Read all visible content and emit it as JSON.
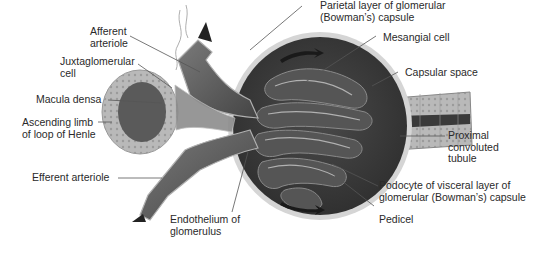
{
  "diagram": {
    "colors": {
      "background": "#ffffff",
      "tissue_dark": "#3a3a3a",
      "tissue_mid": "#6b6b6b",
      "tissue_light": "#a8a8a8",
      "capsule_light": "#c8c8c8",
      "leader_line": "#555555",
      "text": "#2a2a2a"
    },
    "labels": {
      "afferent_arteriole": "Afferent\narteriole",
      "juxtaglomerular_cell": "Juxtaglomerular\ncell",
      "macula_densa": "Macula densa",
      "ascending_limb": "Ascending limb\nof loop of Henle",
      "efferent_arteriole": "Efferent arteriole",
      "endothelium": "Endothelium of\nglomerulus",
      "parietal_layer": "Parietal layer of glomerular\n(Bowman’s) capsule",
      "mesangial_cell": "Mesangial cell",
      "capsular_space": "Capsular space",
      "proximal_tubule": "Proximal\nconvoluted\ntubule",
      "podocyte": "Podocyte of visceral layer of\nglomerular (Bowman’s) capsule",
      "pedicel": "Pedicel"
    }
  }
}
